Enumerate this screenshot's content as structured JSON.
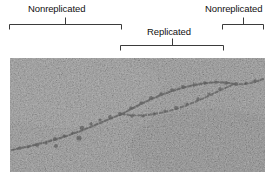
{
  "figure": {
    "type": "electron-micrograph-annotated",
    "annotations": [
      {
        "id": "left-nonreplicated",
        "label": "Nonreplicated",
        "label_x": 28,
        "label_y": 3,
        "bracket_x": 9,
        "bracket_y": 24,
        "bracket_width": 113,
        "tick_offset": 56,
        "tick_up": 7,
        "leg_depth": 5
      },
      {
        "id": "replicated",
        "label": "Replicated",
        "label_x": 147,
        "label_y": 26,
        "bracket_x": 120,
        "bracket_y": 45,
        "bracket_width": 104,
        "tick_offset": 52,
        "tick_up": 7,
        "leg_depth": 5
      },
      {
        "id": "right-nonreplicated",
        "label": "Nonreplicated",
        "label_x": 205,
        "label_y": 3,
        "bracket_x": 222,
        "bracket_y": 24,
        "bracket_width": 42,
        "tick_offset": 21,
        "tick_up": 7,
        "leg_depth": 5
      }
    ],
    "bracket_color": "#3b3b3b",
    "label_color": "#111111",
    "micrograph": {
      "x": 10,
      "y": 58,
      "width": 255,
      "height": 114,
      "background": "#9d9d9d",
      "grain_light": "#cfcfcf",
      "grain_dark": "#6d6d6d",
      "dna_color": "#3a3a3a",
      "description": "Electron micrograph of a replicating DNA molecule showing a replication bubble with two diverging daughter strands",
      "strands": {
        "parent_left": "M 2,92 C 20,88 40,84 62,76 C 80,70 96,62 112,56",
        "bubble_top": "M 112,56 C 132,46 152,36 176,30 C 196,25 212,24 224,26",
        "bubble_bottom": "M 112,56 C 128,58 146,56 166,50 C 188,44 208,34 224,26",
        "parent_right": "M 224,26 C 236,27 244,26 253,22"
      }
    }
  }
}
